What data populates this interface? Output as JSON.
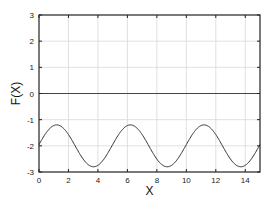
{
  "chart_data": {
    "type": "line",
    "title": "",
    "xlabel": "X",
    "ylabel": "F(X)",
    "xlim": [
      0,
      15
    ],
    "ylim": [
      -3,
      3
    ],
    "xticks": [
      0,
      2,
      4,
      6,
      8,
      10,
      12,
      14
    ],
    "yticks": [
      -3,
      -2,
      -1,
      0,
      1,
      2,
      3
    ],
    "grid": true,
    "legend": null,
    "zero_line": true,
    "series": [
      {
        "name": "F(X)",
        "color": "#333333",
        "function_fit": "F(X) ≈ -2 + 0.8·sin(2πX/5 + 0.06)",
        "x": [
          0,
          0.5,
          1,
          1.2,
          1.5,
          2,
          2.5,
          3,
          3.5,
          3.7,
          4,
          4.5,
          5,
          5.5,
          6,
          6.2,
          6.5,
          7,
          7.5,
          8,
          8.5,
          8.7,
          9,
          9.5,
          10,
          10.5,
          11,
          11.2,
          11.5,
          12,
          12.5,
          13,
          13.5,
          13.7,
          14,
          14.5,
          15
        ],
        "y": [
          -1.95,
          -1.49,
          -1.22,
          -1.2,
          -1.26,
          -1.56,
          -2.0,
          -2.46,
          -2.78,
          -2.8,
          -2.74,
          -2.44,
          -1.95,
          -1.49,
          -1.22,
          -1.2,
          -1.26,
          -1.56,
          -2.0,
          -2.46,
          -2.78,
          -2.8,
          -2.74,
          -2.44,
          -1.95,
          -1.49,
          -1.22,
          -1.2,
          -1.26,
          -1.56,
          -2.0,
          -2.46,
          -2.78,
          -2.8,
          -2.74,
          -2.44,
          -1.95
        ]
      }
    ]
  },
  "colors": {
    "axis": "#222222",
    "grid": "#d8d8d8",
    "zero_line": "#444444",
    "curve": "#333333"
  }
}
